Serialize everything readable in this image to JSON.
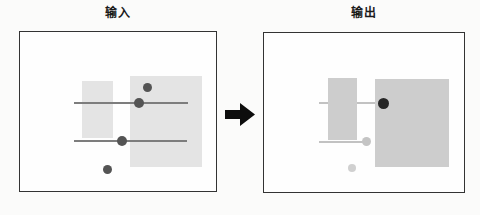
{
  "figure": {
    "background": "#fbfbfa",
    "panels": [
      {
        "id": "input",
        "title": "输入",
        "box": {
          "x": 19,
          "y": 31,
          "w": 198,
          "h": 161,
          "border": "#333333",
          "fill": "#fefefe"
        },
        "shapes": [
          {
            "type": "rect",
            "name": "input-small-gray-region",
            "x": 82,
            "y": 81,
            "w": 31,
            "h": 57,
            "color": "#e4e4e4"
          },
          {
            "type": "rect",
            "name": "input-large-gray-region",
            "x": 130,
            "y": 76,
            "w": 72,
            "h": 91,
            "color": "#e4e4e4"
          },
          {
            "type": "line",
            "name": "input-top-line",
            "x1": 74,
            "y1": 103,
            "x2": 188,
            "y2": 103,
            "thickness": 2,
            "color": "#7d7d7d"
          },
          {
            "type": "line",
            "name": "input-bottom-line",
            "x1": 74,
            "y1": 141,
            "x2": 187,
            "y2": 141,
            "thickness": 2,
            "color": "#7d7d7d"
          },
          {
            "type": "dot",
            "name": "input-dot-upper",
            "cx": 147,
            "cy": 87.5,
            "r": 4.5,
            "color": "#545454"
          },
          {
            "type": "dot",
            "name": "input-dot-on-top-line",
            "cx": 139,
            "cy": 103,
            "r": 5,
            "color": "#545454"
          },
          {
            "type": "dot",
            "name": "input-dot-on-bottom-line",
            "cx": 122,
            "cy": 141,
            "r": 5,
            "color": "#545454"
          },
          {
            "type": "dot",
            "name": "input-dot-lower",
            "cx": 107,
            "cy": 169,
            "r": 4.5,
            "color": "#545454"
          }
        ]
      },
      {
        "id": "output",
        "title": "输出",
        "box": {
          "x": 263,
          "y": 32,
          "w": 202,
          "h": 161,
          "border": "#333333",
          "fill": "#fefefe"
        },
        "shapes": [
          {
            "type": "line",
            "name": "output-top-line",
            "x1": 319,
            "y1": 103,
            "x2": 381,
            "y2": 103,
            "thickness": 2,
            "color": "#c2c2c2"
          },
          {
            "type": "line",
            "name": "output-bottom-line",
            "x1": 319,
            "y1": 141.5,
            "x2": 369,
            "y2": 141.5,
            "thickness": 2,
            "color": "#c2c2c2"
          },
          {
            "type": "rect",
            "name": "output-small-gray-region",
            "x": 328,
            "y": 78,
            "w": 29,
            "h": 62,
            "color": "#cdcdcd"
          },
          {
            "type": "rect",
            "name": "output-large-gray-region",
            "x": 375,
            "y": 79,
            "w": 74,
            "h": 88,
            "color": "#cdcdcd"
          },
          {
            "type": "dot",
            "name": "output-dot-dark",
            "cx": 383,
            "cy": 103.5,
            "r": 5.5,
            "color": "#262626"
          },
          {
            "type": "dot",
            "name": "output-dot-light-on-line",
            "cx": 366,
            "cy": 141.5,
            "r": 4.5,
            "color": "#c4c4c4"
          },
          {
            "type": "dot",
            "name": "output-dot-light-lower",
            "cx": 352,
            "cy": 168,
            "r": 4,
            "color": "#d0d0d0"
          }
        ]
      }
    ],
    "arrow": {
      "x": 225,
      "y": 103,
      "w": 30,
      "h": 23,
      "color": "#0d0d0d"
    }
  }
}
